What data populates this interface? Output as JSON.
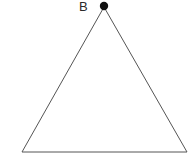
{
  "diagram": {
    "type": "triangle",
    "stroke_color": "#555555",
    "point_color": "#111111",
    "vertices": {
      "apex": {
        "x": 104,
        "y": 7
      },
      "base_left": {
        "x": 22,
        "y": 152
      },
      "base_right": {
        "x": 187,
        "y": 152
      }
    },
    "points": [
      {
        "label": "B",
        "x": 104,
        "y": 6
      }
    ]
  }
}
